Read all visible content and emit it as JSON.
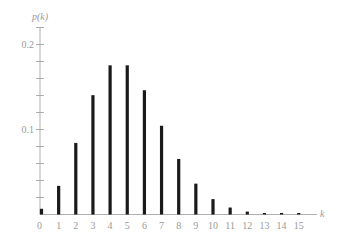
{
  "chart_data": {
    "type": "bar",
    "title": "",
    "xlabel": "k",
    "ylabel": "p(k)",
    "categories": [
      "0",
      "1",
      "2",
      "3",
      "4",
      "5",
      "6",
      "7",
      "8",
      "9",
      "10",
      "11",
      "12",
      "13",
      "14",
      "15"
    ],
    "values": [
      0.0067,
      0.0337,
      0.0842,
      0.1404,
      0.1755,
      0.1755,
      0.1462,
      0.1044,
      0.0653,
      0.0363,
      0.0181,
      0.0082,
      0.0034,
      0.0013,
      0.0005,
      0.0002
    ],
    "ylim": [
      0,
      0.22
    ],
    "yticks_major": [
      0.1,
      0.2
    ],
    "ytick_labels": [
      "0.1",
      "0.2"
    ],
    "yticks_minor_step": 0.02,
    "grid": false,
    "legend": null,
    "bar_color": "#1a1a1a",
    "axis_color": "#9a9a9a"
  }
}
